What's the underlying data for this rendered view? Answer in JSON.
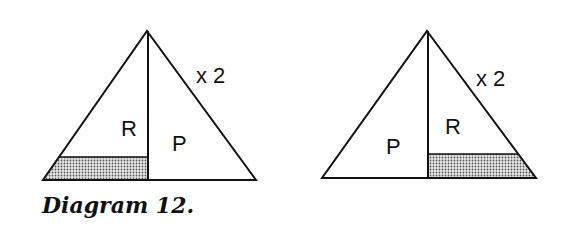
{
  "diagram": {
    "caption": "Diagram 12.",
    "left_figure": {
      "multiplier_label": "x 2",
      "region_upper_left": "R",
      "region_right": "P",
      "shaded_region": "bottom strip under R"
    },
    "right_figure": {
      "multiplier_label": "x 2",
      "region_left": "P",
      "region_upper_right": "R",
      "shaded_region": "bottom strip under R"
    },
    "colors": {
      "stroke": "#111111",
      "shade": "#b9b9b9",
      "background": "#ffffff"
    }
  }
}
